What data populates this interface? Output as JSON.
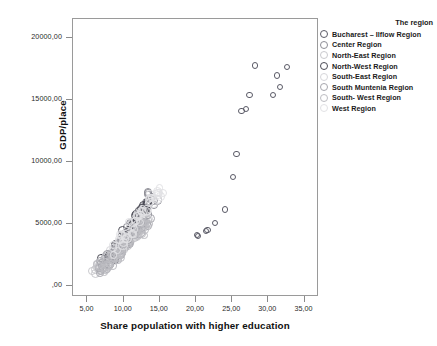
{
  "chart_data": {
    "type": "scatter",
    "title": "",
    "xlabel": "Share population with higher education",
    "ylabel": "GDP/place",
    "xlim": [
      3.0,
      37.0
    ],
    "ylim": [
      -900,
      21500
    ],
    "xticks": [
      "5,00",
      "10,00",
      "15,00",
      "20,00",
      "25,00",
      "30,00",
      "35,00"
    ],
    "xtick_values": [
      5,
      10,
      15,
      20,
      25,
      30,
      35
    ],
    "yticks": [
      ",00",
      "5000,00",
      "10000,00",
      "15000,00",
      "20000,00"
    ],
    "ytick_values": [
      0,
      5000,
      10000,
      15000,
      20000
    ],
    "grid": false,
    "legend_position": "right",
    "legend_title": "The region",
    "series": [
      {
        "name": "Bucharest – Ilfow Region",
        "color": "#5a5a66",
        "points": [
          [
            20.1,
            4100
          ],
          [
            20.3,
            4000
          ],
          [
            21.4,
            4450
          ],
          [
            21.6,
            4500
          ],
          [
            22.6,
            5050
          ],
          [
            24.0,
            6150
          ],
          [
            25.1,
            8800
          ],
          [
            25.6,
            10650
          ],
          [
            26.3,
            14100
          ],
          [
            26.9,
            14250
          ],
          [
            27.4,
            15350
          ],
          [
            28.2,
            17750
          ],
          [
            30.6,
            15350
          ],
          [
            31.2,
            16950
          ],
          [
            31.6,
            16000
          ],
          [
            32.6,
            17600
          ]
        ]
      },
      {
        "name": "Center Region",
        "color": "#8d8d95",
        "points": [
          [
            8.4,
            2450
          ],
          [
            9.1,
            2900
          ],
          [
            9.6,
            3350
          ],
          [
            10.4,
            3900
          ],
          [
            10.9,
            4300
          ],
          [
            11.5,
            4750
          ],
          [
            11.9,
            5200
          ],
          [
            12.4,
            5650
          ],
          [
            12.8,
            6050
          ],
          [
            13.2,
            6500
          ],
          [
            13.6,
            6900
          ],
          [
            14.0,
            7150
          ]
        ]
      },
      {
        "name": "North-East Region",
        "color": "#c9c9cd",
        "points": [
          [
            6.3,
            1250
          ],
          [
            6.8,
            1500
          ],
          [
            7.2,
            1750
          ],
          [
            7.8,
            2050
          ],
          [
            8.2,
            2350
          ],
          [
            8.7,
            2700
          ],
          [
            9.2,
            3000
          ],
          [
            9.7,
            3350
          ],
          [
            10.2,
            3650
          ],
          [
            10.7,
            3950
          ],
          [
            11.2,
            4200
          ],
          [
            11.7,
            4450
          ]
        ]
      },
      {
        "name": "North-West Region",
        "color": "#4b4b55",
        "points": [
          [
            7.6,
            1900
          ],
          [
            8.2,
            2300
          ],
          [
            8.8,
            2750
          ],
          [
            9.3,
            3150
          ],
          [
            9.9,
            3600
          ],
          [
            10.4,
            4050
          ],
          [
            10.9,
            4500
          ],
          [
            11.4,
            4950
          ],
          [
            11.9,
            5400
          ],
          [
            12.3,
            5850
          ],
          [
            12.7,
            6250
          ],
          [
            13.1,
            6650
          ]
        ]
      },
      {
        "name": "South-East Region",
        "color": "#d6d6da",
        "points": [
          [
            7.0,
            1500
          ],
          [
            7.6,
            1800
          ],
          [
            8.1,
            2150
          ],
          [
            8.7,
            2500
          ],
          [
            9.2,
            2850
          ],
          [
            9.8,
            3200
          ],
          [
            10.3,
            3550
          ],
          [
            10.9,
            3900
          ],
          [
            11.4,
            4250
          ],
          [
            11.9,
            4600
          ],
          [
            12.4,
            4900
          ],
          [
            12.9,
            5200
          ]
        ]
      },
      {
        "name": "South Muntenia Region",
        "color": "#a6a6ad",
        "points": [
          [
            6.6,
            1400
          ],
          [
            7.1,
            1700
          ],
          [
            7.7,
            2000
          ],
          [
            8.3,
            2350
          ],
          [
            8.9,
            2700
          ],
          [
            9.5,
            3050
          ],
          [
            10.1,
            3400
          ],
          [
            10.7,
            3750
          ],
          [
            11.3,
            4100
          ],
          [
            11.9,
            4450
          ],
          [
            12.5,
            4800
          ],
          [
            13.1,
            5150
          ]
        ]
      },
      {
        "name": "South- West Region",
        "color": "#bdbdc2",
        "points": [
          [
            6.9,
            1350
          ],
          [
            7.5,
            1650
          ],
          [
            8.1,
            1950
          ],
          [
            8.7,
            2300
          ],
          [
            9.3,
            2650
          ],
          [
            9.9,
            3000
          ],
          [
            10.5,
            3350
          ],
          [
            11.1,
            3700
          ],
          [
            11.7,
            4050
          ],
          [
            12.3,
            4400
          ],
          [
            12.9,
            4750
          ],
          [
            13.5,
            5100
          ]
        ]
      },
      {
        "name": "West Region",
        "color": "#e2e2e5",
        "points": [
          [
            8.9,
            2900
          ],
          [
            9.5,
            3400
          ],
          [
            10.1,
            3900
          ],
          [
            10.7,
            4400
          ],
          [
            11.3,
            4900
          ],
          [
            11.9,
            5400
          ],
          [
            12.5,
            5900
          ],
          [
            13.1,
            6350
          ],
          [
            13.6,
            6750
          ],
          [
            14.1,
            7050
          ],
          [
            14.6,
            7300
          ],
          [
            15.0,
            7550
          ]
        ]
      }
    ]
  },
  "legend": {
    "title": "The region",
    "items": [
      {
        "label": "Bucharest – Ilflow Region",
        "color": "#5a5a66"
      },
      {
        "label": "Center Region",
        "color": "#8d8d95"
      },
      {
        "label": "North-East Region",
        "color": "#c9c9cd"
      },
      {
        "label": "North-West Region",
        "color": "#4b4b55"
      },
      {
        "label": "South-East Region",
        "color": "#d6d6da"
      },
      {
        "label": "South Muntenia Region",
        "color": "#a6a6ad"
      },
      {
        "label": "South- West Region",
        "color": "#bdbdc2"
      },
      {
        "label": "West Region",
        "color": "#e2e2e5"
      }
    ]
  },
  "axes": {
    "x_title": "Share population with higher education",
    "y_title": "GDP/place"
  }
}
